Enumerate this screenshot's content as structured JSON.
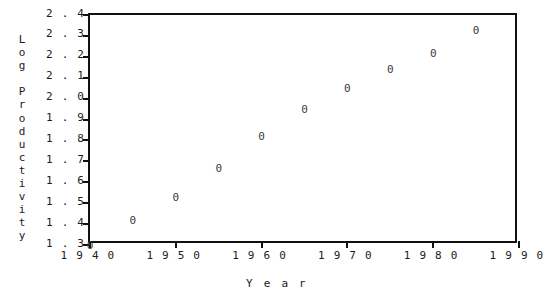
{
  "chart_data": {
    "type": "scatter",
    "title": "",
    "xlabel": "Year",
    "ylabel": "Log Productivity",
    "ylabel_stacked": "L\no\ng\n\nP\nr\no\nd\nu\nc\nt\ni\nv\ni\nt\ny",
    "marker_glyph": "0",
    "marker_color": "#3a3a3a",
    "axis_color": "#111111",
    "background": "#ffffff",
    "grid": false,
    "legend": null,
    "xlim": [
      1940,
      1990
    ],
    "ylim": [
      1.3,
      2.4
    ],
    "xticks": [
      1940,
      1950,
      1960,
      1970,
      1980,
      1990
    ],
    "xtick_labels": [
      "1940",
      "1950",
      "1960",
      "1970",
      "1980",
      "1990"
    ],
    "yticks": [
      1.3,
      1.4,
      1.5,
      1.6,
      1.7,
      1.8,
      1.9,
      2.0,
      2.1,
      2.2,
      2.3,
      2.4
    ],
    "ytick_labels": [
      "1.3",
      "1.4",
      "1.5",
      "1.6",
      "1.7",
      "1.8",
      "1.9",
      "2.0",
      "2.1",
      "2.2",
      "2.3",
      "2.4"
    ],
    "x": [
      1940,
      1945,
      1950,
      1955,
      1960,
      1965,
      1970,
      1975,
      1980,
      1985
    ],
    "values": [
      1.3,
      1.42,
      1.53,
      1.67,
      1.82,
      1.95,
      2.05,
      2.14,
      2.22,
      2.33
    ],
    "points": [
      {
        "x": 1940,
        "y": 1.3
      },
      {
        "x": 1945,
        "y": 1.42
      },
      {
        "x": 1950,
        "y": 1.53
      },
      {
        "x": 1955,
        "y": 1.67
      },
      {
        "x": 1960,
        "y": 1.82
      },
      {
        "x": 1965,
        "y": 1.95
      },
      {
        "x": 1970,
        "y": 2.05
      },
      {
        "x": 1975,
        "y": 2.14
      },
      {
        "x": 1980,
        "y": 2.22
      },
      {
        "x": 1985,
        "y": 2.33
      }
    ]
  }
}
